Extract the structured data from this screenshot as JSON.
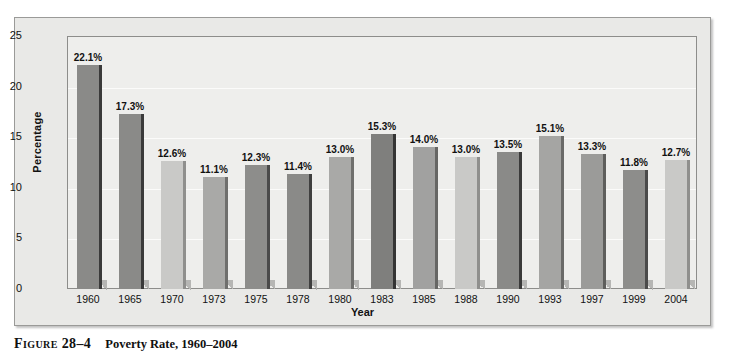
{
  "figure": {
    "label": "Figure 28–4",
    "caption": "Poverty Rate, 1960–2004"
  },
  "chart_data": {
    "type": "bar",
    "title": "Poverty Rate, 1960–2004",
    "xlabel": "Year",
    "ylabel": "Percentage",
    "categories": [
      "1960",
      "1965",
      "1970",
      "1973",
      "1975",
      "1978",
      "1980",
      "1983",
      "1985",
      "1988",
      "1990",
      "1993",
      "1997",
      "1999",
      "2004"
    ],
    "values": [
      22.1,
      17.3,
      12.6,
      11.1,
      12.3,
      11.4,
      13.0,
      15.3,
      14.0,
      13.0,
      13.5,
      15.1,
      13.3,
      11.8,
      12.7
    ],
    "value_labels": [
      "22.1%",
      "17.3%",
      "12.6%",
      "11.1%",
      "12.3%",
      "11.4%",
      "13.0%",
      "15.3%",
      "14.0%",
      "13.0%",
      "13.5%",
      "15.1%",
      "13.3%",
      "11.8%",
      "12.7%"
    ],
    "bar_colors": [
      "#8a8a88",
      "#8a8a88",
      "#c9c9c7",
      "#a9a9a7",
      "#8d8d8b",
      "#8a8a88",
      "#a9a9a7",
      "#7f7f7d",
      "#a1a1a0",
      "#c9c9c7",
      "#8a8a88",
      "#a5a5a3",
      "#9b9b99",
      "#8d8d8b",
      "#c9c9c7"
    ],
    "bar_side_colors": [
      "#3a3a3a",
      "#3a3a3a",
      "#8f8f8d",
      "#6f6f6d",
      "#4a4a4a",
      "#3f3f3f",
      "#6f6f6d",
      "#343434",
      "#666664",
      "#8f8f8d",
      "#3a3a3a",
      "#6a6a68",
      "#5e5e5c",
      "#4a4a4a",
      "#8f8f8d"
    ],
    "ylim": [
      0,
      25
    ],
    "yticks": [
      25,
      20,
      15,
      10,
      5,
      0
    ],
    "ytick_labels": [
      "25",
      "20",
      "15",
      "10",
      "5",
      "0"
    ],
    "grid": true,
    "legend": null
  }
}
